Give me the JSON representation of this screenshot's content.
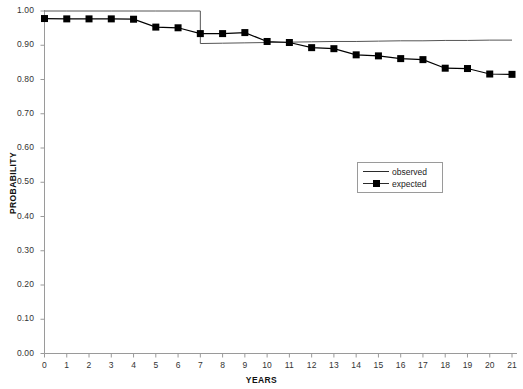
{
  "chart_data": {
    "type": "line",
    "title": "",
    "xlabel": "YEARS",
    "ylabel": "PROBABILITY",
    "xlim": [
      0,
      21
    ],
    "ylim": [
      0.0,
      1.0
    ],
    "grid": false,
    "legend_position": "center-right",
    "x": [
      0,
      1,
      2,
      3,
      4,
      5,
      6,
      7,
      8,
      9,
      10,
      11,
      12,
      13,
      14,
      15,
      16,
      17,
      18,
      19,
      20,
      21
    ],
    "xticks": [
      "0",
      "1",
      "2",
      "3",
      "4",
      "5",
      "6",
      "7",
      "8",
      "9",
      "10",
      "11",
      "12",
      "13",
      "14",
      "15",
      "16",
      "17",
      "18",
      "19",
      "20",
      "21"
    ],
    "yticks": [
      "0.00",
      "0.10",
      "0.20",
      "0.30",
      "0.40",
      "0.50",
      "0.60",
      "0.70",
      "0.80",
      "0.90",
      "1.00"
    ],
    "ytick_values": [
      0.0,
      0.1,
      0.2,
      0.3,
      0.4,
      0.5,
      0.6,
      0.7,
      0.8,
      0.9,
      1.0
    ],
    "series": [
      {
        "name": "observed",
        "style": "step-line",
        "marker": "none",
        "color": "#555555",
        "x": [
          0,
          1,
          2,
          3,
          4,
          5,
          6,
          7,
          7,
          8,
          9,
          10,
          11,
          12,
          13,
          14,
          15,
          16,
          17,
          18,
          19,
          20,
          21
        ],
        "values": [
          1.0,
          1.0,
          1.0,
          1.0,
          1.0,
          1.0,
          1.0,
          1.0,
          0.905,
          0.906,
          0.907,
          0.908,
          0.909,
          0.91,
          0.911,
          0.911,
          0.912,
          0.913,
          0.913,
          0.914,
          0.914,
          0.915,
          0.915
        ]
      },
      {
        "name": "expected",
        "style": "line",
        "marker": "square",
        "color": "#000000",
        "x": [
          0,
          1,
          2,
          3,
          4,
          5,
          6,
          7,
          8,
          9,
          10,
          11,
          12,
          13,
          14,
          15,
          16,
          17,
          18,
          19,
          20,
          21
        ],
        "values": [
          0.978,
          0.977,
          0.977,
          0.977,
          0.976,
          0.953,
          0.951,
          0.934,
          0.934,
          0.937,
          0.911,
          0.908,
          0.893,
          0.89,
          0.872,
          0.869,
          0.861,
          0.858,
          0.833,
          0.832,
          0.816,
          0.815
        ]
      }
    ]
  },
  "legend": {
    "items": [
      {
        "label": "observed",
        "marker": "none"
      },
      {
        "label": "expected",
        "marker": "square"
      }
    ]
  }
}
